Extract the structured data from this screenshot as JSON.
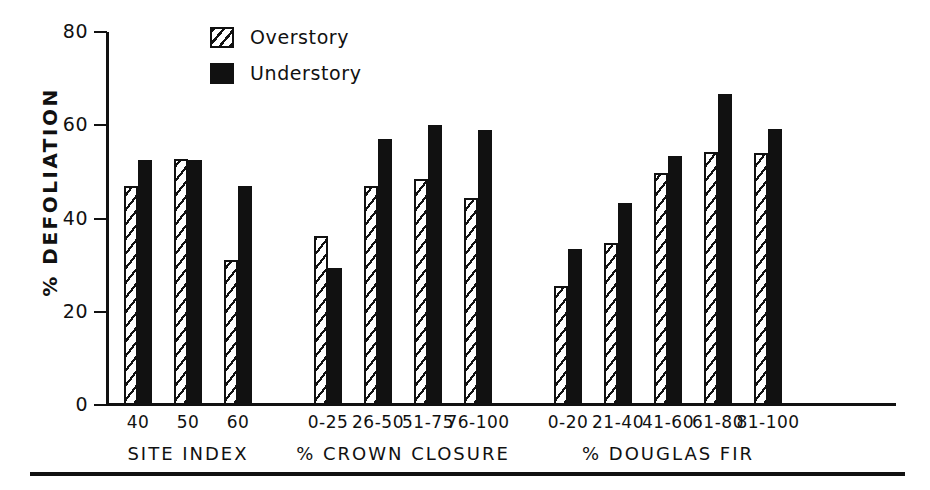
{
  "chart_data": {
    "type": "bar",
    "title": "",
    "xlabel": "",
    "ylabel": "% DEFOLIATION",
    "ylim": [
      0,
      80
    ],
    "yticks": [
      0,
      20,
      40,
      60,
      80
    ],
    "ytick_labels": [
      "0",
      "20",
      "40",
      "60",
      "80"
    ],
    "grid": false,
    "legend_position": "top-center",
    "series": [
      {
        "name": "Overstory",
        "style": "hatched",
        "color": "#111111",
        "values": [
          47.0,
          52.8,
          31.0,
          36.3,
          47.0,
          48.5,
          44.3,
          25.6,
          34.8,
          49.8,
          54.3,
          54.0
        ]
      },
      {
        "name": "Understory",
        "style": "solid",
        "color": "#111111",
        "values": [
          52.6,
          52.6,
          47.0,
          29.3,
          57.0,
          60.0,
          59.0,
          33.5,
          43.3,
          53.5,
          66.8,
          59.3
        ]
      }
    ],
    "categories": [
      "40",
      "50",
      "60",
      "0-25",
      "26-50",
      "51-75",
      "76-100",
      "0-20",
      "21-40",
      "41-60",
      "61-80",
      "81-100"
    ],
    "groups": [
      {
        "label": "SITE INDEX",
        "categories": [
          "40",
          "50",
          "60"
        ]
      },
      {
        "label": "% CROWN  CLOSURE",
        "categories": [
          "0-25",
          "26-50",
          "51-75",
          "76-100"
        ]
      },
      {
        "label": "% DOUGLAS  FIR",
        "categories": [
          "0-20",
          "21-40",
          "41-60",
          "61-80",
          "81-100"
        ]
      }
    ]
  },
  "legend": {
    "items": [
      {
        "label": "Overstory",
        "swatch": "hatched-square-icon"
      },
      {
        "label": "Understory",
        "swatch": "solid-square-icon"
      }
    ]
  }
}
